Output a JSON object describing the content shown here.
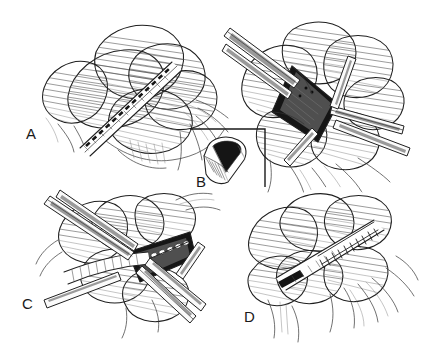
{
  "figure": {
    "type": "surgical-technique-illustration",
    "style": "pen-and-ink hatched line drawing, grayscale",
    "background_color": "#ffffff",
    "ink_color": "#1f1f1f",
    "width": 425,
    "height": 349,
    "panel_count": 4
  },
  "panels": [
    {
      "id": "A",
      "label": "A",
      "label_x": 26,
      "label_y": 139,
      "caption": "Planned longitudinal incision marked over exposed vessel between tissue folds",
      "features": [
        "dashed incision line",
        "overlying tissue folds",
        "retracted fascia",
        "branching vessels"
      ]
    },
    {
      "id": "B",
      "label": "B",
      "label_x": 203,
      "label_y": 187,
      "caption": "Incision opened and held by retractors exposing the dark vessel lumen",
      "features": [
        "four retractors",
        "diamond-shaped opening",
        "dark lumen",
        "cross-section inset"
      ],
      "inset": {
        "label": "vessel cross-section",
        "frame_x": 190,
        "frame_y": 128,
        "frame_width": 76,
        "frame_height": 58,
        "description": "Cut tubular vessel end showing open triangular lumen"
      }
    },
    {
      "id": "C",
      "label": "C",
      "label_x": 28,
      "label_y": 309,
      "caption": "Instruments placing sutures along the everted vessel edge within the opened field",
      "features": [
        "forceps",
        "needle holder",
        "suture row",
        "retractors",
        "everted edges"
      ]
    },
    {
      "id": "D",
      "label": "D",
      "label_x": 250,
      "label_y": 322,
      "caption": "Completed closure showing the ladder-like running suture line along the repaired vessel",
      "features": [
        "ladder suture line",
        "closed vessel",
        "restored tissue planes",
        "branching vessels"
      ]
    }
  ],
  "colors": {
    "ink": "#1f1f1f",
    "hatch": "#4a4a4a",
    "hatch_light": "#7d7d7d",
    "lumen_dark": "#151515",
    "background": "#ffffff"
  }
}
